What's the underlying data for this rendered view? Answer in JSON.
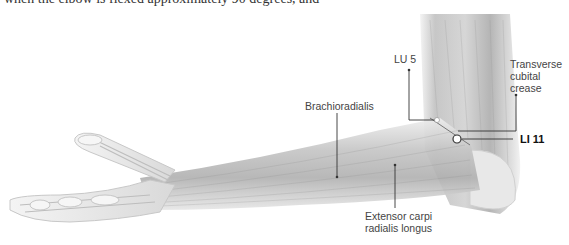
{
  "caption": {
    "cropped_line": "when the elbow is flexed approximately 90 degrees, and"
  },
  "figure": {
    "labels": {
      "brachioradialis": "Brachioradialis",
      "lu5": "LU 5",
      "transverse_line1": "Transverse",
      "transverse_line2": "cubital",
      "transverse_line3": "crease",
      "li11": "LI 11",
      "ecrl_line1": "Extensor carpi",
      "ecrl_line2": "radialis longus"
    },
    "colors": {
      "leader_line": "#333333",
      "point_marker": "#ffffff",
      "text": "#444444"
    }
  }
}
